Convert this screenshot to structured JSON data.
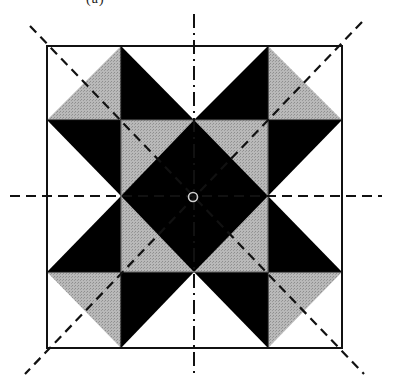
{
  "figure": {
    "caption_fragment": "(a)",
    "colors": {
      "black": "#000000",
      "gray": "#b4b4b4",
      "white": "#ffffff",
      "line": "#111111",
      "center_marker": "#c8c8c8"
    },
    "grid": {
      "x": [
        47,
        121,
        194,
        268,
        342
      ],
      "y": [
        46,
        120,
        196,
        272,
        348
      ]
    },
    "symmetry_axes": {
      "vertical": "dash-dot",
      "horizontal": "dashed",
      "diagonals": "dashed"
    },
    "center_marker": {
      "type": "circle",
      "label": "rotation-center"
    }
  }
}
